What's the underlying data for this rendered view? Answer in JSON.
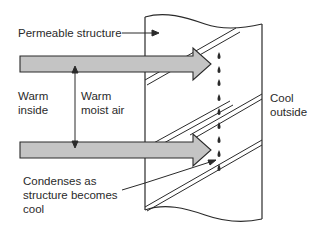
{
  "diagram": {
    "labels": {
      "permeable_structure": "Permeable structure",
      "warm_inside_line1": "Warm",
      "warm_inside_line2": "inside",
      "warm_moist_air_line1": "Warm",
      "warm_moist_air_line2": "moist air",
      "cool_outside_line1": "Cool",
      "cool_outside_line2": "outside",
      "condenses_line1": "Condenses as",
      "condenses_line2": "structure becomes",
      "condenses_line3": "cool"
    },
    "colors": {
      "arrow_fill": "#c4c4c4",
      "stroke": "#2a2a2a",
      "background": "#ffffff"
    },
    "elements": {
      "flow_arrows": 2,
      "condensation_drops": 9,
      "diagonal_double_lines": 4
    }
  }
}
